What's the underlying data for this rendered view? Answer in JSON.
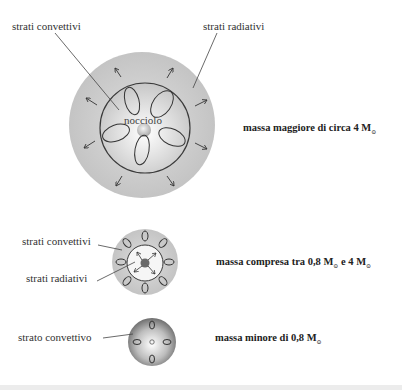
{
  "diagrams": [
    {
      "id": "large",
      "labels": {
        "convective": "strati convettivi",
        "radiative": "strati radiativi",
        "core": "nocciolo"
      },
      "caption": {
        "text": "massa maggiore di circa 4 M",
        "sub": "⊙"
      }
    },
    {
      "id": "medium",
      "labels": {
        "convective": "strati convettivi",
        "radiative": "strati radiativi"
      },
      "caption": {
        "text": "massa compresa tra 0,8 M",
        "sub": "⊙",
        "text2": " e 4 M",
        "sub2": "⊙"
      }
    },
    {
      "id": "small",
      "labels": {
        "convective": "strato convettivo"
      },
      "caption": {
        "text": "massa minore di 0,8 M",
        "sub": "⊙"
      }
    }
  ],
  "colors": {
    "outer_gray": "#c8c8c8",
    "line": "#3a3a3a",
    "background": "#ffffff"
  }
}
